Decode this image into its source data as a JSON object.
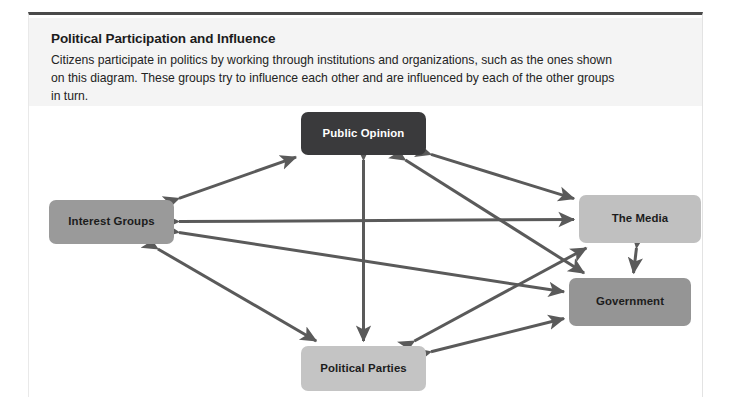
{
  "header": {
    "title": "Political Participation and Influence",
    "description": "Citizens participate in politics by working through institutions and organizations, such as the ones shown on this diagram. These groups try to influence each other and are influenced by each of the other groups in turn."
  },
  "diagram": {
    "type": "influence-network",
    "arrow_color": "#5a5a5a",
    "nodes": [
      {
        "id": "public-opinion",
        "label": "Public Opinion",
        "fill": "#3a3a3c",
        "text_color": "#ffffff",
        "x": 272,
        "y": 6,
        "w": 125,
        "h": 43
      },
      {
        "id": "interest-groups",
        "label": "Interest Groups",
        "fill": "#9a9a9a",
        "text_color": "#1c1c1c",
        "x": 20,
        "y": 94,
        "w": 125,
        "h": 44
      },
      {
        "id": "the-media",
        "label": "The Media",
        "fill": "#c0c0c0",
        "text_color": "#1c1c1c",
        "x": 550,
        "y": 89,
        "w": 122,
        "h": 48
      },
      {
        "id": "government",
        "label": "Government",
        "fill": "#959595",
        "text_color": "#1c1c1c",
        "x": 540,
        "y": 172,
        "w": 122,
        "h": 48
      },
      {
        "id": "political-parties",
        "label": "Political Parties",
        "fill": "#c4c4c4",
        "text_color": "#1c1c1c",
        "x": 272,
        "y": 240,
        "w": 125,
        "h": 45
      }
    ],
    "connections": [
      {
        "from": "interest-groups",
        "to": "public-opinion",
        "style": "double-headed"
      },
      {
        "from": "public-opinion",
        "to": "the-media",
        "style": "double-headed"
      },
      {
        "from": "interest-groups",
        "to": "the-media",
        "style": "double-headed"
      },
      {
        "from": "interest-groups",
        "to": "government",
        "style": "double-headed"
      },
      {
        "from": "interest-groups",
        "to": "political-parties",
        "style": "double-headed"
      },
      {
        "from": "public-opinion",
        "to": "political-parties",
        "style": "double-headed"
      },
      {
        "from": "public-opinion",
        "to": "government",
        "style": "double-headed"
      },
      {
        "from": "political-parties",
        "to": "the-media",
        "style": "double-headed"
      },
      {
        "from": "political-parties",
        "to": "government",
        "style": "double-headed"
      },
      {
        "from": "the-media",
        "to": "government",
        "style": "double-headed"
      }
    ]
  }
}
